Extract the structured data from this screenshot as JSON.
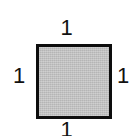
{
  "figure": {
    "shape_name": "square",
    "fill_color": "#bebebe",
    "stroke_color": "#0d0d0d",
    "background_color": "#ffffff",
    "text_color": "#121212"
  },
  "labels": {
    "top": "1",
    "right": "1",
    "bottom": "1",
    "left": "1"
  }
}
